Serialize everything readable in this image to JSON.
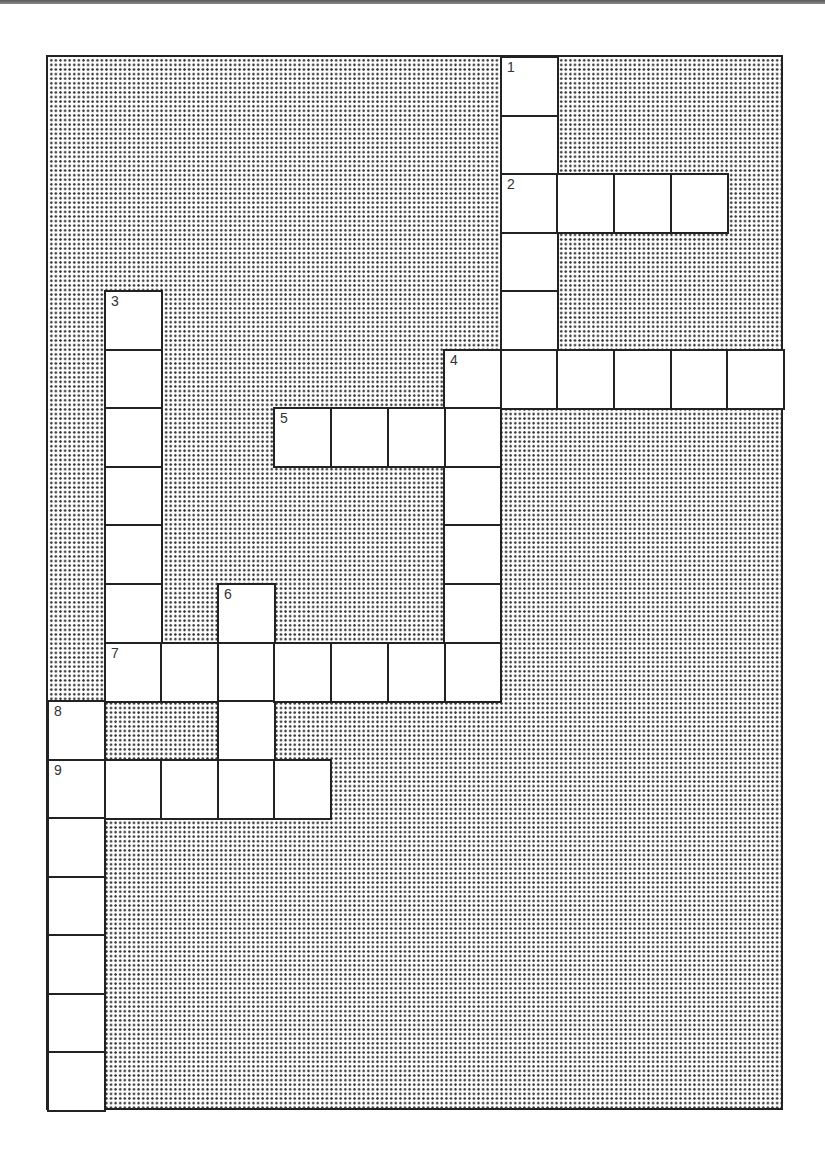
{
  "puzzle": {
    "type": "crossword",
    "grid": {
      "cols": 13,
      "rows": 18,
      "origin_x": 47,
      "origin_y": 56,
      "cell_width": 56.6,
      "cell_height": 58.55
    },
    "colors": {
      "cell_fill": "#ffffff",
      "border": "#222222",
      "block_dots": "#3a3a3a",
      "number_text": "#333333"
    },
    "entries": [
      {
        "number": "1",
        "direction": "down",
        "row": 0,
        "col": 8,
        "length": 6
      },
      {
        "number": "2",
        "direction": "across",
        "row": 2,
        "col": 8,
        "length": 4
      },
      {
        "number": "3",
        "direction": "down",
        "row": 4,
        "col": 1,
        "length": 7
      },
      {
        "number": "4",
        "direction": "across",
        "row": 5,
        "col": 7,
        "length": 6
      },
      {
        "number": "4",
        "direction": "down",
        "row": 5,
        "col": 7,
        "length": 6
      },
      {
        "number": "5",
        "direction": "across",
        "row": 6,
        "col": 4,
        "length": 4
      },
      {
        "number": "6",
        "direction": "down",
        "row": 9,
        "col": 3,
        "length": 4
      },
      {
        "number": "7",
        "direction": "across",
        "row": 10,
        "col": 1,
        "length": 7
      },
      {
        "number": "8",
        "direction": "down",
        "row": 11,
        "col": 0,
        "length": 7
      },
      {
        "number": "9",
        "direction": "across",
        "row": 12,
        "col": 0,
        "length": 5
      }
    ]
  }
}
